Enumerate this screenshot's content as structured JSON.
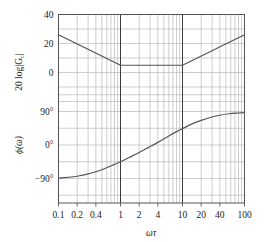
{
  "chart_data": {
    "type": "line",
    "title": "",
    "subtitle": "",
    "xlabel": "ωτ",
    "xscale": "log",
    "xlim": [
      0.1,
      100
    ],
    "xticks": [
      0.1,
      0.2,
      0.4,
      1,
      2,
      4,
      10,
      20,
      40,
      100
    ],
    "xticklabels": [
      "0.1",
      "0.2",
      "0.4",
      "1",
      "2",
      "4",
      "10",
      "20",
      "40",
      "100"
    ],
    "grid": true,
    "grid_minor": true,
    "legend": "none",
    "panels": [
      {
        "name": "magnitude",
        "ylabel": "20 log|G_c|",
        "ylabel_parts": {
          "prefix": "20 log|",
          "base": "G",
          "sub": "c",
          "suffix": "|"
        },
        "ylim": [
          -20,
          40
        ],
        "yticks": [
          40,
          20,
          0
        ],
        "yticklabels": [
          "40",
          "20",
          "0"
        ],
        "series": [
          {
            "name": "magnitude-curve",
            "color": "#555555",
            "x": [
              0.1,
              1.0,
              10.0,
              100.0
            ],
            "y": [
              26,
              5,
              5,
              26
            ]
          }
        ]
      },
      {
        "name": "phase",
        "ylabel": "ϕ(ω)",
        "ylim": [
          -135,
          135
        ],
        "yticks": [
          90,
          0,
          -90
        ],
        "yticklabels": [
          "90°",
          "0°",
          "−90°"
        ],
        "series": [
          {
            "name": "phase-curve",
            "color": "#555555",
            "x": [
              0.1,
              0.14,
              0.2,
              0.28,
              0.4,
              0.56,
              0.8,
              1.0,
              1.4,
              2.0,
              2.8,
              4.0,
              5.6,
              8.0,
              10.0,
              14.0,
              20.0,
              28.0,
              40.0,
              56.0,
              80.0,
              100.0
            ],
            "y": [
              -89,
              -87,
              -84,
              -79,
              -72,
              -63,
              -52,
              -45,
              -33,
              -20,
              -7,
              7,
              21,
              36,
              44,
              56,
              66,
              74,
              80,
              84,
              86,
              87
            ]
          }
        ]
      }
    ],
    "decade_lines": [
      1,
      10
    ],
    "colors": {
      "curve": "#555555",
      "grid_minor": "#b9b9b9",
      "grid_major": "#8f8f8f",
      "frame": "#555555",
      "text": "#1a1a1a",
      "background": "#ffffff"
    }
  },
  "tick_text": {
    "x": [
      "0.1",
      "0.2",
      "0.4",
      "1",
      "2",
      "4",
      "10",
      "20",
      "40",
      "100"
    ],
    "y_mag": [
      "40",
      "20",
      "0"
    ],
    "y_phase": [
      "90°",
      "0°",
      "−90°"
    ]
  },
  "labels": {
    "xaxis": "ωτ",
    "yaxis_magnitude": "20 log|G",
    "yaxis_magnitude_sub": "c",
    "yaxis_magnitude_tail": "|",
    "yaxis_phase_open": "ϕ(",
    "yaxis_phase_omega": "ω",
    "yaxis_phase_close": ")"
  }
}
